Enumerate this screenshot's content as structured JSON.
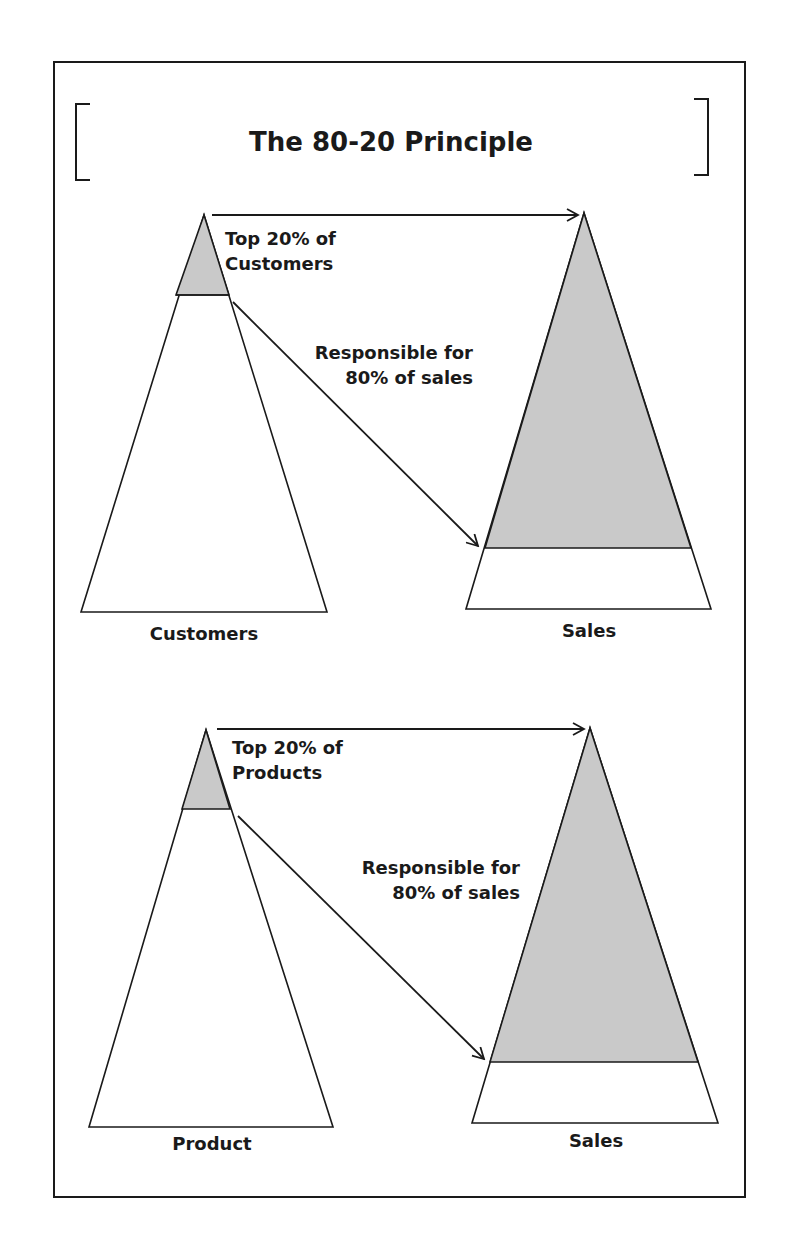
{
  "title": "The 80-20 Principle",
  "colors": {
    "stroke": "#1a1a1a",
    "shade": "#c9c9c9",
    "background": "#ffffff"
  },
  "panels": [
    {
      "top_label_line1": "Top 20% of",
      "top_label_line2": "Customers",
      "arrow_label_line1": "Responsible for",
      "arrow_label_line2": "80% of sales",
      "left_caption": "Customers",
      "right_caption": "Sales"
    },
    {
      "top_label_line1": "Top 20% of",
      "top_label_line2": "Products",
      "arrow_label_line1": "Responsible for",
      "arrow_label_line2": "80% of sales",
      "left_caption": "Product",
      "right_caption": "Sales"
    }
  ]
}
